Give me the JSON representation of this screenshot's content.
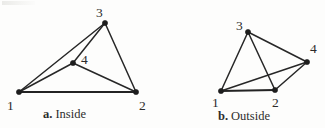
{
  "figure": {
    "background_color": "#fdfdfc",
    "line_color": "#272727",
    "vertex_color": "#1d1d1d",
    "label_color": "#2b2b2b",
    "panels": [
      {
        "id": "panel-a",
        "caption_letter": "a.",
        "caption_word": "Inside",
        "caption_full": "a. Inside",
        "description": "Quadrilateral with vertex 4 inside triangle 1-2-3",
        "vertices": [
          {
            "id": "v1",
            "label": "1",
            "x": 19,
            "y": 92,
            "label_x": 7,
            "label_y": 99
          },
          {
            "id": "v2",
            "label": "2",
            "x": 136,
            "y": 92,
            "label_x": 139,
            "label_y": 99
          },
          {
            "id": "v3",
            "label": "3",
            "x": 105,
            "y": 23,
            "label_x": 96,
            "label_y": 6
          },
          {
            "id": "v4",
            "label": "4",
            "x": 73,
            "y": 63,
            "label_x": 81,
            "label_y": 53
          }
        ],
        "edges": [
          {
            "from": "v1",
            "to": "v2",
            "weight": "thick"
          },
          {
            "from": "v1",
            "to": "v3",
            "weight": "normal"
          },
          {
            "from": "v1",
            "to": "v4",
            "weight": "normal"
          },
          {
            "from": "v2",
            "to": "v3",
            "weight": "normal"
          },
          {
            "from": "v2",
            "to": "v4",
            "weight": "normal"
          },
          {
            "from": "v3",
            "to": "v4",
            "weight": "normal"
          }
        ]
      },
      {
        "id": "panel-b",
        "caption_letter": "b.",
        "caption_word": "Outside",
        "caption_full": "b. Outside",
        "description": "Quadrilateral with vertex 4 outside triangle 1-2-3, edges 3-2 and 1-4 cross",
        "vertices": [
          {
            "id": "v1",
            "label": "1",
            "x": 221,
            "y": 91,
            "label_x": 212,
            "label_y": 96
          },
          {
            "id": "v2",
            "label": "2",
            "x": 275,
            "y": 90,
            "label_x": 272,
            "label_y": 96
          },
          {
            "id": "v3",
            "label": "3",
            "x": 248,
            "y": 32,
            "label_x": 236,
            "label_y": 19
          },
          {
            "id": "v4",
            "label": "4",
            "x": 307,
            "y": 62,
            "label_x": 310,
            "label_y": 42
          }
        ],
        "edges": [
          {
            "from": "v1",
            "to": "v2",
            "weight": "thick"
          },
          {
            "from": "v1",
            "to": "v3",
            "weight": "normal"
          },
          {
            "from": "v1",
            "to": "v4",
            "weight": "normal"
          },
          {
            "from": "v2",
            "to": "v3",
            "weight": "normal"
          },
          {
            "from": "v2",
            "to": "v4",
            "weight": "normal"
          },
          {
            "from": "v3",
            "to": "v4",
            "weight": "normal"
          }
        ]
      }
    ],
    "captions": [
      {
        "id": "caption-a",
        "letter": "a.",
        "word": "Inside",
        "x": 43,
        "y": 108
      },
      {
        "id": "caption-b",
        "letter": "b.",
        "word": "Outside",
        "x": 218,
        "y": 110
      }
    ]
  }
}
